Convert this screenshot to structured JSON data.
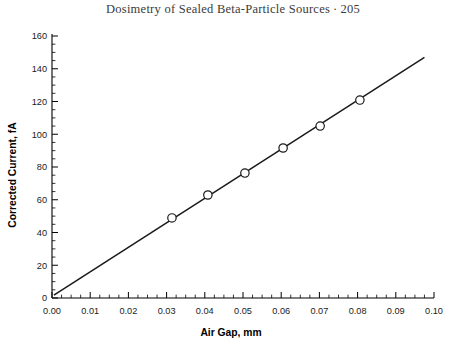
{
  "running_head": {
    "title": "Dosimetry of Sealed Beta-Particle Sources",
    "separator": "·",
    "page": "205"
  },
  "chart_data": {
    "type": "scatter",
    "title": "",
    "xlabel": "Air Gap, mm",
    "ylabel": "Corrected Current, fA",
    "xlim": [
      0.0,
      0.1
    ],
    "ylim": [
      0,
      160
    ],
    "grid": false,
    "legend": null,
    "x_ticks": [
      "0.00",
      "0.01",
      "0.02",
      "0.03",
      "0.04",
      "0.05",
      "0.06",
      "0.07",
      "0.08",
      "0.09",
      "0.10"
    ],
    "x_tick_values": [
      0.0,
      0.01,
      0.02,
      0.03,
      0.04,
      0.05,
      0.06,
      0.07,
      0.08,
      0.09,
      0.1
    ],
    "x_minor_step": 0.0025,
    "y_ticks": [
      "0",
      "20",
      "40",
      "60",
      "80",
      "100",
      "120",
      "140",
      "160"
    ],
    "y_tick_values": [
      0,
      20,
      40,
      60,
      80,
      100,
      120,
      140,
      160
    ],
    "y_minor_step": 5,
    "marker_style": "open-circle",
    "marker_radius_px": 4.2,
    "series": [
      {
        "name": "Corrected Current",
        "x": [
          0.0314,
          0.0408,
          0.0505,
          0.0605,
          0.0702,
          0.0806
        ],
        "values": [
          48.9,
          62.9,
          76.3,
          91.6,
          105.0,
          120.9
        ]
      }
    ],
    "fit_line": {
      "name": "Linear fit",
      "x": [
        0.0005,
        0.0975
      ],
      "y": [
        1.8,
        147.0
      ]
    },
    "colors": {
      "line": "#1a1a1a",
      "marker_fill": "#ffffff",
      "marker_stroke": "#1a1a1a",
      "axis": "#000000",
      "text": "#1a1a1a"
    }
  }
}
